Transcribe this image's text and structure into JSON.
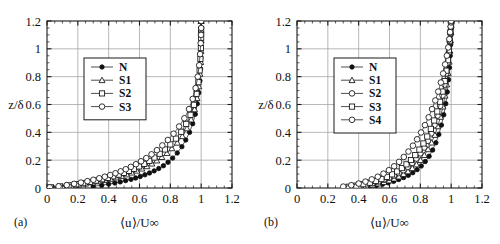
{
  "figure": {
    "panels": [
      {
        "tag": "(a)",
        "xlabel": "⟨u⟩/U∞",
        "ylabel": "z/δ",
        "legend_title": "",
        "legend": [
          "N",
          "S1",
          "S2",
          "S3"
        ]
      },
      {
        "tag": "(b)",
        "xlabel": "⟨u⟩/U∞",
        "ylabel": "z/δ",
        "legend_title": "",
        "legend": [
          "N",
          "S1",
          "S2",
          "S3",
          "S4"
        ]
      }
    ],
    "xticklabels": [
      "0",
      "0.2",
      "0.4",
      "0.6",
      "0.8",
      "1",
      "1.2"
    ],
    "yticklabels": [
      "0",
      "0.2",
      "0.4",
      "0.6",
      "0.8",
      "1",
      "1.2"
    ]
  },
  "chart_data": [
    {
      "type": "line",
      "panel": "(a)",
      "title": "",
      "xlabel": "⟨u⟩/U∞",
      "ylabel": "z/δ",
      "xlim": [
        0,
        1.2
      ],
      "ylim": [
        0,
        1.2
      ],
      "xticks": [
        0,
        0.2,
        0.4,
        0.6,
        0.8,
        1.0,
        1.2
      ],
      "yticks": [
        0,
        0.2,
        0.4,
        0.6,
        0.8,
        1.0,
        1.2
      ],
      "grid": true,
      "legend_position": "upper-left-inset",
      "series": [
        {
          "name": "N",
          "marker": "filled-circle",
          "x": [
            0.3,
            0.355,
            0.4,
            0.44,
            0.475,
            0.51,
            0.545,
            0.575,
            0.605,
            0.635,
            0.665,
            0.695,
            0.725,
            0.755,
            0.785,
            0.815,
            0.845,
            0.875,
            0.9,
            0.925,
            0.945,
            0.962,
            0.975,
            0.985,
            0.992,
            0.996,
            0.998,
            0.999,
            1.0,
            1.0
          ],
          "y": [
            0.012,
            0.02,
            0.028,
            0.036,
            0.044,
            0.053,
            0.062,
            0.072,
            0.083,
            0.095,
            0.108,
            0.123,
            0.14,
            0.16,
            0.185,
            0.215,
            0.252,
            0.297,
            0.345,
            0.4,
            0.462,
            0.53,
            0.605,
            0.685,
            0.77,
            0.855,
            0.935,
            1.02,
            1.11,
            1.2
          ]
        },
        {
          "name": "S1",
          "marker": "triangle",
          "x": [
            0.04,
            0.1,
            0.155,
            0.205,
            0.25,
            0.295,
            0.335,
            0.375,
            0.412,
            0.448,
            0.483,
            0.517,
            0.55,
            0.583,
            0.615,
            0.648,
            0.68,
            0.712,
            0.745,
            0.778,
            0.81,
            0.845,
            0.878,
            0.908,
            0.935,
            0.957,
            0.973,
            0.985,
            0.992,
            0.997,
            0.999,
            1.0,
            1.0,
            1.0
          ],
          "y": [
            0.004,
            0.01,
            0.017,
            0.024,
            0.031,
            0.039,
            0.047,
            0.056,
            0.065,
            0.075,
            0.086,
            0.097,
            0.11,
            0.124,
            0.139,
            0.156,
            0.175,
            0.197,
            0.222,
            0.251,
            0.285,
            0.325,
            0.372,
            0.428,
            0.492,
            0.565,
            0.645,
            0.73,
            0.82,
            0.905,
            0.985,
            1.06,
            1.13,
            1.2
          ]
        },
        {
          "name": "S2",
          "marker": "square",
          "x": [
            0.025,
            0.085,
            0.14,
            0.19,
            0.235,
            0.278,
            0.318,
            0.357,
            0.394,
            0.43,
            0.465,
            0.499,
            0.532,
            0.565,
            0.598,
            0.631,
            0.664,
            0.697,
            0.731,
            0.765,
            0.8,
            0.836,
            0.871,
            0.903,
            0.931,
            0.953,
            0.97,
            0.982,
            0.99,
            0.995,
            0.998,
            1.0,
            1.0,
            1.0
          ],
          "y": [
            0.004,
            0.011,
            0.019,
            0.027,
            0.035,
            0.044,
            0.053,
            0.063,
            0.073,
            0.084,
            0.096,
            0.109,
            0.123,
            0.138,
            0.155,
            0.174,
            0.195,
            0.219,
            0.246,
            0.277,
            0.313,
            0.355,
            0.404,
            0.461,
            0.526,
            0.598,
            0.677,
            0.76,
            0.845,
            0.928,
            1.005,
            1.08,
            1.14,
            1.2
          ]
        },
        {
          "name": "S3",
          "marker": "circle",
          "x": [
            0.018,
            0.075,
            0.128,
            0.176,
            0.22,
            0.262,
            0.301,
            0.339,
            0.375,
            0.41,
            0.444,
            0.478,
            0.511,
            0.544,
            0.577,
            0.61,
            0.644,
            0.678,
            0.713,
            0.748,
            0.784,
            0.821,
            0.857,
            0.891,
            0.921,
            0.945,
            0.964,
            0.978,
            0.987,
            0.993,
            0.997,
            0.999,
            1.0,
            1.0
          ],
          "y": [
            0.005,
            0.012,
            0.021,
            0.03,
            0.039,
            0.049,
            0.059,
            0.07,
            0.081,
            0.093,
            0.106,
            0.12,
            0.135,
            0.152,
            0.171,
            0.192,
            0.215,
            0.242,
            0.272,
            0.306,
            0.345,
            0.39,
            0.442,
            0.501,
            0.567,
            0.64,
            0.718,
            0.8,
            0.882,
            0.962,
            1.04,
            1.1,
            1.15,
            1.2
          ]
        }
      ]
    },
    {
      "type": "line",
      "panel": "(b)",
      "title": "",
      "xlabel": "⟨u⟩/U∞",
      "ylabel": "z/δ",
      "xlim": [
        0,
        1.2
      ],
      "ylim": [
        0,
        1.2
      ],
      "xticks": [
        0,
        0.2,
        0.4,
        0.6,
        0.8,
        1.0,
        1.2
      ],
      "yticks": [
        0,
        0.2,
        0.4,
        0.6,
        0.8,
        1.0,
        1.2
      ],
      "grid": true,
      "legend_position": "upper-left-inset",
      "series": [
        {
          "name": "N",
          "marker": "filled-circle",
          "x": [
            0.47,
            0.515,
            0.555,
            0.592,
            0.627,
            0.66,
            0.692,
            0.722,
            0.751,
            0.779,
            0.806,
            0.832,
            0.857,
            0.88,
            0.901,
            0.92,
            0.937,
            0.952,
            0.965,
            0.975,
            0.983,
            0.989,
            0.994,
            0.997,
            0.999,
            1.0,
            1.0
          ],
          "y": [
            0.01,
            0.018,
            0.027,
            0.037,
            0.048,
            0.061,
            0.075,
            0.091,
            0.11,
            0.132,
            0.158,
            0.19,
            0.228,
            0.273,
            0.325,
            0.385,
            0.452,
            0.526,
            0.606,
            0.69,
            0.778,
            0.865,
            0.95,
            1.03,
            1.1,
            1.16,
            1.2
          ]
        },
        {
          "name": "S1",
          "marker": "triangle",
          "x": [
            0.4,
            0.448,
            0.49,
            0.528,
            0.564,
            0.598,
            0.63,
            0.661,
            0.691,
            0.72,
            0.748,
            0.775,
            0.801,
            0.826,
            0.85,
            0.873,
            0.894,
            0.913,
            0.931,
            0.947,
            0.96,
            0.971,
            0.98,
            0.987,
            0.992,
            0.996,
            0.998,
            1.0,
            1.0
          ],
          "y": [
            0.008,
            0.015,
            0.023,
            0.032,
            0.042,
            0.054,
            0.067,
            0.082,
            0.099,
            0.119,
            0.142,
            0.169,
            0.2,
            0.236,
            0.278,
            0.326,
            0.381,
            0.443,
            0.511,
            0.585,
            0.663,
            0.744,
            0.826,
            0.907,
            0.985,
            1.06,
            1.12,
            1.17,
            1.2
          ]
        },
        {
          "name": "S2",
          "marker": "circle",
          "x": [
            0.355,
            0.405,
            0.45,
            0.49,
            0.528,
            0.563,
            0.597,
            0.629,
            0.66,
            0.69,
            0.719,
            0.747,
            0.774,
            0.8,
            0.825,
            0.849,
            0.871,
            0.892,
            0.911,
            0.929,
            0.944,
            0.957,
            0.968,
            0.977,
            0.985,
            0.991,
            0.995,
            0.998,
            1.0,
            1.0
          ],
          "y": [
            0.008,
            0.016,
            0.025,
            0.035,
            0.046,
            0.059,
            0.073,
            0.089,
            0.107,
            0.128,
            0.152,
            0.18,
            0.212,
            0.249,
            0.291,
            0.339,
            0.393,
            0.453,
            0.519,
            0.59,
            0.665,
            0.743,
            0.822,
            0.9,
            0.975,
            1.05,
            1.11,
            1.16,
            1.19,
            1.2
          ]
        },
        {
          "name": "S3",
          "marker": "square",
          "x": [
            0.335,
            0.385,
            0.43,
            0.472,
            0.511,
            0.548,
            0.583,
            0.617,
            0.649,
            0.68,
            0.71,
            0.739,
            0.767,
            0.794,
            0.82,
            0.845,
            0.868,
            0.89,
            0.91,
            0.928,
            0.944,
            0.958,
            0.969,
            0.979,
            0.986,
            0.992,
            0.996,
            0.999,
            1.0,
            1.0
          ],
          "y": [
            0.009,
            0.017,
            0.027,
            0.038,
            0.05,
            0.064,
            0.08,
            0.098,
            0.119,
            0.143,
            0.17,
            0.201,
            0.236,
            0.276,
            0.32,
            0.37,
            0.425,
            0.485,
            0.55,
            0.62,
            0.693,
            0.768,
            0.843,
            0.918,
            0.99,
            1.06,
            1.12,
            1.16,
            1.19,
            1.2
          ]
        },
        {
          "name": "S4",
          "marker": "circle",
          "x": [
            0.3,
            0.352,
            0.4,
            0.444,
            0.485,
            0.524,
            0.561,
            0.596,
            0.63,
            0.662,
            0.693,
            0.723,
            0.752,
            0.779,
            0.805,
            0.83,
            0.854,
            0.876,
            0.897,
            0.916,
            0.933,
            0.948,
            0.961,
            0.972,
            0.981,
            0.988,
            0.993,
            0.997,
            0.999,
            1.0
          ],
          "y": [
            0.01,
            0.02,
            0.032,
            0.046,
            0.062,
            0.081,
            0.103,
            0.128,
            0.156,
            0.188,
            0.223,
            0.262,
            0.304,
            0.35,
            0.399,
            0.452,
            0.508,
            0.567,
            0.629,
            0.693,
            0.758,
            0.823,
            0.888,
            0.951,
            1.01,
            1.07,
            1.12,
            1.16,
            1.19,
            1.2
          ]
        }
      ]
    }
  ]
}
